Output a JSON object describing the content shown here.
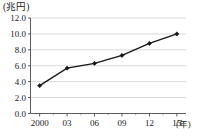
{
  "chart_data": {
    "type": "line",
    "title": "",
    "subtitle": "",
    "xlabel": "(年)",
    "ylabel": "(兆円)",
    "y_unit_label": "(兆円)",
    "x_unit_label": "(年)",
    "categories": [
      "2000",
      "03",
      "06",
      "09",
      "12",
      "15"
    ],
    "x": [
      2000,
      2003,
      2006,
      2009,
      2012,
      2015
    ],
    "values": [
      3.5,
      5.7,
      6.3,
      7.3,
      8.8,
      10.0
    ],
    "series": [
      {
        "name": "",
        "values": [
          3.5,
          5.7,
          6.3,
          7.3,
          8.8,
          10.0
        ]
      }
    ],
    "xlim": [
      1999,
      2016
    ],
    "ylim": [
      0.0,
      12.0
    ],
    "y_ticks": [
      "0.0",
      "2.0",
      "4.0",
      "6.0",
      "8.0",
      "10.0",
      "12.0"
    ],
    "y_tick_values": [
      0.0,
      2.0,
      4.0,
      6.0,
      8.0,
      10.0,
      12.0
    ],
    "x_ticks": [
      "2000",
      "03",
      "06",
      "09",
      "12",
      "15"
    ],
    "grid": true,
    "grid_axis": "y",
    "legend": false,
    "legend_position": "none",
    "marker": "diamond",
    "line_color": "#171717",
    "grid_color": "#c8c8c8",
    "axis_color": "#4a4a4a",
    "background_color": "#ffffff",
    "annotations": []
  }
}
